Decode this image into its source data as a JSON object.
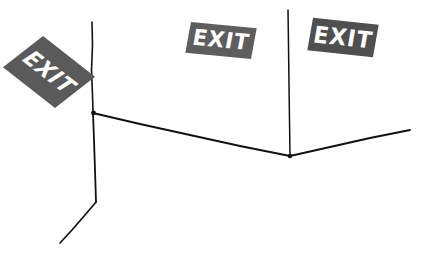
{
  "scene": {
    "title": "Exit signs at a wall corner",
    "width": 432,
    "height": 262,
    "background_color": "#ffffff"
  },
  "signs": [
    {
      "id": "exit-sign-1",
      "label": "EXIT",
      "background_color": "#5a5a5a",
      "text_color": "#ffffff",
      "position": "left",
      "orientation": "steeply rotated, oblique view"
    },
    {
      "id": "exit-sign-2",
      "label": "EXIT",
      "background_color": "#5e5e5e",
      "text_color": "#ffffff",
      "position": "center",
      "orientation": "slight downward tilt"
    },
    {
      "id": "exit-sign-3",
      "label": "EXIT",
      "background_color": "#4f4f4f",
      "text_color": "#ffffff",
      "position": "right",
      "orientation": "slight downward tilt"
    }
  ],
  "line_art": {
    "stroke_color": "#111111",
    "description": "Hand-drawn wall corner: two vertical edges and a floor/ceiling junction line",
    "strokes": [
      {
        "name": "left-vertical-edge",
        "points": "92,22 92.5,45 91.5,70 92.5,95 93,113"
      },
      {
        "name": "left-lower-edge",
        "points": "93,113 94,140 95,170 96,202"
      },
      {
        "name": "left-floor-diagonal",
        "points": "96,202 85,215 72,230 60,243"
      },
      {
        "name": "center-junction-line",
        "points": "93,113 140,124 190,135 240,146 290,156"
      },
      {
        "name": "right-vertical-edge",
        "points": "288,10 288.5,45 289,85 289.5,120 290,156"
      },
      {
        "name": "right-junction-line",
        "points": "290,156 330,147 370,138 410,130"
      }
    ]
  }
}
